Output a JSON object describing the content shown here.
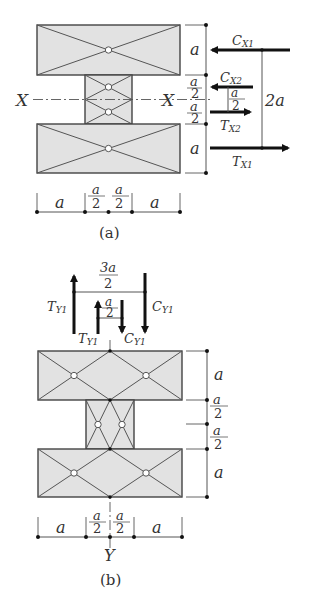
{
  "figure_a": {
    "caption": "(a)",
    "axis_label_left": "X",
    "axis_label_right": "X",
    "dims_vertical": [
      "a",
      "a",
      "2",
      "a",
      "2",
      "a"
    ],
    "dims_horizontal": [
      "a",
      "a",
      "2",
      "a",
      "2",
      "a"
    ],
    "forces": {
      "cx1": {
        "main": "C",
        "sub": "X1"
      },
      "cx2": {
        "main": "C",
        "sub": "X2"
      },
      "tx2": {
        "main": "T",
        "sub": "X2"
      },
      "tx1": {
        "main": "T",
        "sub": "X1"
      }
    },
    "lever_small_num": "a",
    "lever_small_den": "2",
    "lever_large": "2a"
  },
  "figure_b": {
    "caption": "(b)",
    "axis_label": "Y",
    "lever_large_num": "3a",
    "lever_large_den": "2",
    "lever_small_num": "a",
    "lever_small_den": "2",
    "forces": {
      "ty1_outer": {
        "main": "T",
        "sub": "Y1"
      },
      "cy1_outer": {
        "main": "C",
        "sub": "Y1"
      },
      "ty1_inner": {
        "main": "T",
        "sub": "Y1"
      },
      "cy1_inner": {
        "main": "C",
        "sub": "Y1"
      }
    },
    "dims_vertical": [
      "a",
      "a",
      "2",
      "a",
      "2",
      "a"
    ],
    "dims_horizontal": [
      "a",
      "a",
      "2",
      "a",
      "2",
      "a"
    ]
  },
  "colors": {
    "fill": "#e2e2e2",
    "stroke": "#444444",
    "arrow": "#111111"
  }
}
